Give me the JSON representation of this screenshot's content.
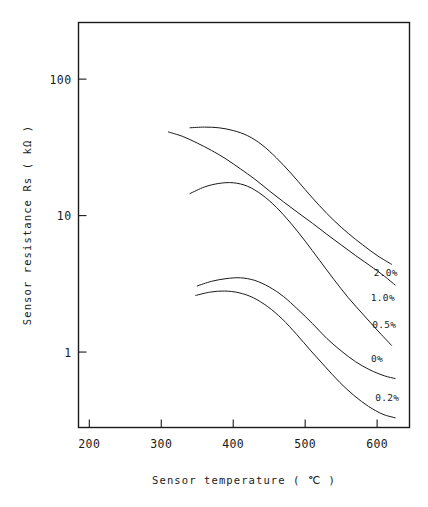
{
  "chart_data": {
    "type": "line",
    "title": "",
    "subtitle": "",
    "xlabel": "Sensor temperature ( ℃ )",
    "ylabel": "Sensor resistance Rs ( kΩ )",
    "xscale": "linear",
    "yscale": "log",
    "xlim": [
      185,
      645
    ],
    "ylim": [
      0.28,
      260
    ],
    "grid": false,
    "legend_position": "inline-right-of-curve-ends",
    "x_ticks": [
      200,
      300,
      400,
      500,
      600
    ],
    "x_tick_labels": [
      "200",
      "300",
      "400",
      "500",
      "600"
    ],
    "y_ticks": [
      1,
      10,
      100
    ],
    "y_tick_labels": [
      "1",
      "10",
      "100"
    ],
    "annotations": [
      {
        "text": "2.0%",
        "x": 612,
        "y": 3.6
      },
      {
        "text": "1.0%",
        "x": 608,
        "y": 2.35
      },
      {
        "text": "0.5%",
        "x": 610,
        "y": 1.5
      },
      {
        "text": "0%",
        "x": 600,
        "y": 0.85
      },
      {
        "text": "0.2%",
        "x": 614,
        "y": 0.44
      }
    ],
    "series": [
      {
        "name": "2.0%",
        "label": "2.0%",
        "x": [
          340,
          360,
          380,
          400,
          420,
          440,
          460,
          480,
          500,
          520,
          540,
          560,
          580,
          600,
          620
        ],
        "values": [
          44,
          44.5,
          44,
          42,
          38.5,
          33,
          26.5,
          20.5,
          15.5,
          11.8,
          9.2,
          7.4,
          6.1,
          5.1,
          4.4
        ]
      },
      {
        "name": "1.0%",
        "label": "1.0%",
        "x": [
          310,
          330,
          350,
          370,
          390,
          410,
          430,
          450,
          470,
          490,
          510,
          530,
          550,
          570,
          590,
          610,
          625
        ],
        "values": [
          41,
          38,
          34,
          30,
          26,
          22,
          18.5,
          15.2,
          12.6,
          10.5,
          8.8,
          7.3,
          6.1,
          5.1,
          4.3,
          3.6,
          3.1
        ]
      },
      {
        "name": "0.5%",
        "label": "0.5%",
        "x": [
          340,
          360,
          380,
          400,
          420,
          440,
          460,
          480,
          500,
          520,
          540,
          560,
          580,
          600,
          620
        ],
        "values": [
          14.5,
          16.2,
          17.2,
          17.4,
          16.4,
          14.2,
          11.5,
          8.8,
          6.5,
          4.7,
          3.4,
          2.5,
          1.9,
          1.45,
          1.12
        ]
      },
      {
        "name": "0%",
        "label": "0%",
        "x": [
          350,
          370,
          390,
          410,
          430,
          450,
          470,
          490,
          510,
          530,
          550,
          570,
          590,
          610,
          625
        ],
        "values": [
          3.05,
          3.3,
          3.45,
          3.5,
          3.35,
          3.0,
          2.55,
          2.05,
          1.62,
          1.26,
          1.02,
          0.85,
          0.74,
          0.67,
          0.64
        ]
      },
      {
        "name": "0.2%",
        "label": "0.2%",
        "x": [
          348,
          368,
          388,
          408,
          428,
          448,
          468,
          488,
          508,
          528,
          548,
          568,
          588,
          608,
          625
        ],
        "values": [
          2.6,
          2.75,
          2.8,
          2.72,
          2.5,
          2.15,
          1.75,
          1.35,
          1.02,
          0.78,
          0.6,
          0.48,
          0.4,
          0.35,
          0.33
        ]
      }
    ]
  },
  "figure": {
    "xlabel": "Sensor temperature ( ℃ )",
    "ylabel": "Sensor resistance Rs ( kΩ )"
  }
}
